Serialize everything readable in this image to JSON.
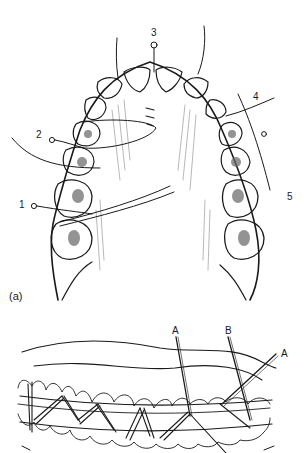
{
  "figure": {
    "panel_a": {
      "label": "(a)",
      "description": "Occlusal view of upper dental arch with interdental wire ligatures",
      "wire_labels": [
        "1",
        "2",
        "3",
        "4",
        "5"
      ]
    },
    "panel_b": {
      "description": "Frontal view of dental arch with continuous loop wiring",
      "wire_labels": [
        "A",
        "B",
        "A"
      ]
    }
  },
  "colors": {
    "ink": "#1a1a1a",
    "background": "#ffffff",
    "hatch": "#888888"
  }
}
